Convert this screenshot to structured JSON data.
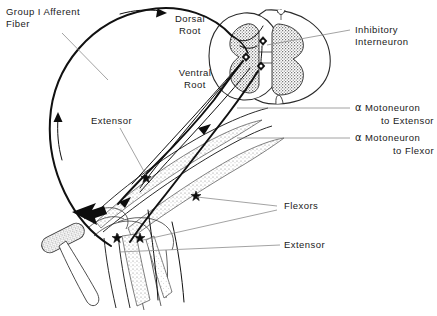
{
  "figure": {
    "background_color": "#ffffff",
    "ink_color": "#1a1a1a",
    "leader_color": "#8c8c8c",
    "width": 437,
    "height": 316
  },
  "labels": {
    "group_i_afferent_line1": "Group I Afferent",
    "group_i_afferent_line2": "Fiber",
    "dorsal_root_line1": "Dorsal",
    "dorsal_root_line2": "Root",
    "ventral_root_line1": "Ventral",
    "ventral_root_line2": "Root",
    "inhibitory_interneuron_line1": "Inhibitory",
    "inhibitory_interneuron_line2": "Interneuron",
    "alpha_moto_extensor_symbol": "α",
    "alpha_moto_extensor_line1": "Motoneuron",
    "alpha_moto_extensor_line2": "to Extensor",
    "alpha_moto_flexor_symbol": "α",
    "alpha_moto_flexor_line1": "Motoneuron",
    "alpha_moto_flexor_line2": "to Flexor",
    "extensor_upper": "Extensor",
    "flexors_right": "Flexors",
    "extensor_right": "Extensor"
  },
  "structures": {
    "spinal_cord": "spinal-cord-cross-section",
    "gray_matter": "butterfly-gray-matter",
    "reflex_hammer": "reflex-hammer",
    "strike_arrow": "tendon-strike-arrow",
    "muscle_spindle_extensor": "muscle-spindle-extensor",
    "muscle_spindle_flexor": "muscle-spindle-flexor",
    "afferent_loop": "group-i-afferent-fiber-loop",
    "knee_joint": "knee-joint-outline"
  }
}
